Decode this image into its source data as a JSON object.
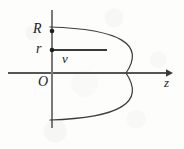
{
  "figure": {
    "kind": "parabolic-velocity-profile-diagram",
    "caption": "",
    "background_color": "#fdfdfc",
    "ink_color": "#2b2b2b",
    "curve_color": "#3a3a3a",
    "label_color": "#1c1c1c"
  },
  "axes": {
    "horizontal": {
      "name": "z",
      "label": "z",
      "arrowhead": "solid-triangle-right",
      "y": 73,
      "x_start": 8,
      "x_end": 172
    },
    "vertical": {
      "name": "radial",
      "label": "",
      "arrowhead": "none",
      "x": 52,
      "y_top": 10,
      "y_bottom": 128
    },
    "origin": {
      "label": "O",
      "x": 52,
      "y": 73
    }
  },
  "markers": [
    {
      "label": "R",
      "x": 52,
      "y": 31,
      "style": "filled-dot",
      "meaning": "pipe-radius"
    },
    {
      "label": "r",
      "x": 52,
      "y": 50,
      "style": "filled-dot",
      "meaning": "radial-coordinate"
    }
  ],
  "annotations": [
    {
      "label": "v",
      "x": 67,
      "y": 60,
      "meaning": "velocity-at-radius-r"
    }
  ],
  "velocity_vector": {
    "label": "v",
    "from_x": 52,
    "from_y": 50,
    "to_x": 107,
    "to_y": 50
  },
  "parabola": {
    "description": "leftward-opening parabola, vertex on z axis",
    "vertex": {
      "x": 126,
      "y": 73
    },
    "top_end": {
      "x": 50,
      "y": 27
    },
    "bottom_end": {
      "x": 50,
      "y": 120
    },
    "passes_through_R": {
      "x": 52,
      "y": 31
    },
    "passes_through_r_line": {
      "x": 107,
      "y": 50
    }
  },
  "chart_data": {
    "type": "line",
    "title": "",
    "xlabel": "z",
    "ylabel": "r",
    "grid": false,
    "legend": null,
    "annotations": [
      "R",
      "r",
      "v",
      "O",
      "z"
    ],
    "series": [
      {
        "name": "velocity-profile",
        "comment": "v(r) proportional to (R^2 - r^2); plotted with z horizontal, r vertical",
        "r_values": [
          1.0,
          0.8,
          0.6,
          0.4,
          0.2,
          0.0,
          -0.2,
          -0.4,
          -0.6,
          -0.8,
          -1.0
        ],
        "v_values": [
          0.0,
          0.36,
          0.64,
          0.84,
          0.96,
          1.0,
          0.96,
          0.84,
          0.64,
          0.36,
          0.0
        ]
      }
    ],
    "markers": [
      {
        "name": "R",
        "r": 1.0,
        "v": 0.0
      },
      {
        "name": "r",
        "r": 0.55,
        "v": 0.7
      }
    ]
  }
}
